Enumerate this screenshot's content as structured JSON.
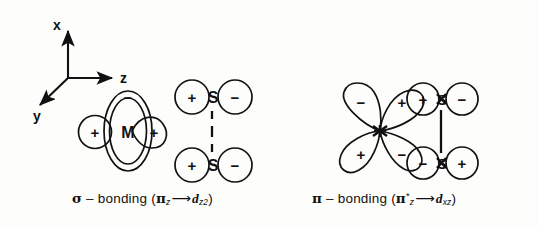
{
  "figure": {
    "background": "#fdfdfb",
    "ink": "#111111",
    "type": "orbital-overlap-diagram"
  },
  "axes": {
    "label": "axis-key",
    "x_label": "x",
    "y_label": "y",
    "z_label": "z",
    "x_direction": "up",
    "y_direction": "down-left",
    "z_direction": "right"
  },
  "panels": [
    {
      "id": "sigma",
      "metal_label": "M",
      "metal_orbital": "d_z2",
      "torus_sign": "−",
      "lobe_left_sign": "+",
      "lobe_right_sign": "+",
      "sulfur_top": {
        "atom": "S",
        "left_sign": "+",
        "right_sign": "−"
      },
      "sulfur_bottom": {
        "atom": "S",
        "left_sign": "+",
        "right_sign": "−"
      },
      "bond_style": "dashed",
      "caption": {
        "symbol": "σ",
        "dash": "–",
        "word": "bonding",
        "open": "(",
        "donor": "π",
        "donor_sub": "z",
        "donor_sup": "",
        "arrow": "⟶",
        "acceptor": "d",
        "acceptor_sub": "z2",
        "close": ")"
      }
    },
    {
      "id": "pi",
      "metal_label": "",
      "metal_orbital": "d_xz",
      "lobe_upper_left_sign": "−",
      "lobe_upper_right_sign": "+",
      "lobe_lower_left_sign": "+",
      "lobe_lower_right_sign": "−",
      "sulfur_top": {
        "atom": "S",
        "left_sign": "+",
        "right_sign": "−"
      },
      "sulfur_bottom": {
        "atom": "S",
        "left_sign": "−",
        "right_sign": "+"
      },
      "bond_style": "solid",
      "caption": {
        "symbol": "π",
        "dash": "–",
        "word": "bonding",
        "open": "(",
        "donor": "π",
        "donor_sub": "z",
        "donor_sup": "*",
        "arrow": "⟶",
        "acceptor": "d",
        "acceptor_sub": "xz",
        "close": ")"
      }
    }
  ]
}
